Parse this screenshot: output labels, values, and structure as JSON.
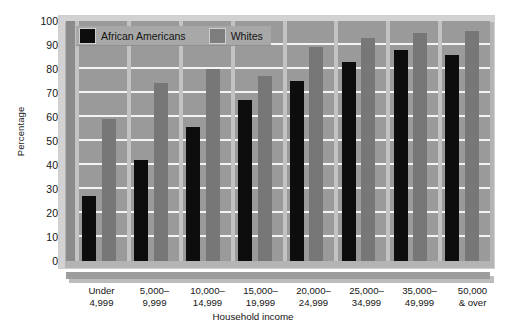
{
  "chart_data": {
    "type": "bar",
    "title": "",
    "xlabel": "Household income",
    "ylabel": "Percentage",
    "ylim": [
      0,
      100
    ],
    "ytick_step": 10,
    "yticks": [
      100,
      90,
      80,
      70,
      60,
      50,
      40,
      30,
      20,
      10,
      0
    ],
    "grid": true,
    "legend_position": "top-left-inside",
    "categories": [
      [
        "Under",
        "4,999"
      ],
      [
        "5,000–",
        "9,999"
      ],
      [
        "10,000–",
        "14,999"
      ],
      [
        "15,000–",
        "19,999"
      ],
      [
        "20,000–",
        "24,999"
      ],
      [
        "25,000–",
        "34,999"
      ],
      [
        "35,000–",
        "49,999"
      ],
      [
        "50,000",
        "& over"
      ]
    ],
    "series": [
      {
        "name": "African Americans",
        "color": "#0d0d0d",
        "values": [
          27,
          42,
          56,
          67,
          75,
          83,
          88,
          86
        ]
      },
      {
        "name": "Whites",
        "color": "#777777",
        "values": [
          59,
          74,
          80,
          77,
          89,
          93,
          95,
          96
        ]
      }
    ]
  },
  "legend": {
    "items": [
      {
        "label": "African Americans",
        "swatch": "black"
      },
      {
        "label": "Whites",
        "swatch": "gray"
      }
    ]
  },
  "colors": {
    "plot_background": "#9a9a9a",
    "gridline": "#f4f4f4",
    "frame": "#d2d2d2",
    "axis_band": "#9d9d9d",
    "series_african_americans": "#0d0d0d",
    "series_whites": "#777777",
    "text": "#151515"
  }
}
